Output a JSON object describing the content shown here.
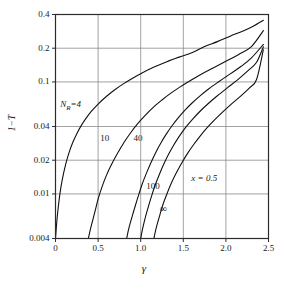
{
  "chart_data": {
    "type": "line",
    "title": "",
    "xlabel": "γ",
    "ylabel": "1−T",
    "xlim": [
      0,
      2.5
    ],
    "ylim": [
      0.004,
      0.4
    ],
    "yscale": "log",
    "xscale": "linear",
    "grid": true,
    "legend": "inline-curve-labels",
    "xticks": [
      "0",
      "0.5",
      "1.0",
      "1.5",
      "2.0",
      "2.5"
    ],
    "xtick_values": [
      0,
      0.5,
      1.0,
      1.5,
      2.0,
      2.5
    ],
    "yticks": [
      "0.4",
      "0.2",
      "0.1",
      "0.04",
      "0.02",
      "0.01",
      "0.004"
    ],
    "ytick_values": [
      0.4,
      0.2,
      0.1,
      0.04,
      0.02,
      0.01,
      0.004
    ],
    "annotations": [
      {
        "text": "N",
        "sub": "R",
        "suffix": "=4",
        "x": 0.16,
        "y": 0.062
      },
      {
        "text": "10",
        "x": 0.63,
        "y": 0.031
      },
      {
        "text": "40",
        "x": 1.02,
        "y": 0.031
      },
      {
        "text": "100",
        "x": 1.17,
        "y": 0.0115
      },
      {
        "text": "∞",
        "x": 1.33,
        "y": 0.0074
      },
      {
        "text": "x = 0.5",
        "x": 1.7,
        "y": 0.0135
      }
    ],
    "series": [
      {
        "name": "N_R=4",
        "label": "N_R=4",
        "points": [
          [
            0.0,
            0.004
          ],
          [
            0.02,
            0.0062
          ],
          [
            0.05,
            0.0098
          ],
          [
            0.08,
            0.0135
          ],
          [
            0.12,
            0.0185
          ],
          [
            0.16,
            0.0235
          ],
          [
            0.2,
            0.0285
          ],
          [
            0.25,
            0.0345
          ],
          [
            0.3,
            0.0405
          ],
          [
            0.36,
            0.0475
          ],
          [
            0.42,
            0.0545
          ],
          [
            0.5,
            0.0635
          ],
          [
            0.6,
            0.0745
          ],
          [
            0.7,
            0.0855
          ],
          [
            0.8,
            0.0965
          ],
          [
            0.9,
            0.1075
          ],
          [
            1.0,
            0.1185
          ],
          [
            1.15,
            0.135
          ],
          [
            1.3,
            0.151
          ],
          [
            1.45,
            0.1665
          ],
          [
            1.6,
            0.182
          ],
          [
            1.75,
            0.207
          ],
          [
            1.9,
            0.229
          ],
          [
            2.05,
            0.256
          ],
          [
            2.2,
            0.285
          ],
          [
            2.32,
            0.314
          ],
          [
            2.44,
            0.355
          ]
        ]
      },
      {
        "name": "10",
        "label": "10",
        "points": [
          [
            0.385,
            0.004
          ],
          [
            0.42,
            0.0052
          ],
          [
            0.46,
            0.0068
          ],
          [
            0.5,
            0.009
          ],
          [
            0.55,
            0.0118
          ],
          [
            0.6,
            0.0148
          ],
          [
            0.66,
            0.0185
          ],
          [
            0.72,
            0.0225
          ],
          [
            0.8,
            0.0285
          ],
          [
            0.88,
            0.035
          ],
          [
            0.96,
            0.042
          ],
          [
            1.05,
            0.05
          ],
          [
            1.15,
            0.0595
          ],
          [
            1.25,
            0.069
          ],
          [
            1.35,
            0.079
          ],
          [
            1.45,
            0.089
          ],
          [
            1.55,
            0.0995
          ],
          [
            1.7,
            0.116
          ],
          [
            1.85,
            0.133
          ],
          [
            2.0,
            0.153
          ],
          [
            2.15,
            0.176
          ],
          [
            2.3,
            0.207
          ],
          [
            2.44,
            0.287
          ]
        ]
      },
      {
        "name": "40",
        "label": "40",
        "points": [
          [
            0.835,
            0.004
          ],
          [
            0.86,
            0.0049
          ],
          [
            0.9,
            0.0063
          ],
          [
            0.94,
            0.008
          ],
          [
            0.98,
            0.01
          ],
          [
            1.02,
            0.0124
          ],
          [
            1.07,
            0.0155
          ],
          [
            1.12,
            0.019
          ],
          [
            1.18,
            0.0237
          ],
          [
            1.24,
            0.0288
          ],
          [
            1.3,
            0.0342
          ],
          [
            1.37,
            0.0408
          ],
          [
            1.44,
            0.0478
          ],
          [
            1.52,
            0.056
          ],
          [
            1.6,
            0.0645
          ],
          [
            1.7,
            0.0755
          ],
          [
            1.8,
            0.087
          ],
          [
            1.92,
            0.101
          ],
          [
            2.05,
            0.118
          ],
          [
            2.18,
            0.138
          ],
          [
            2.3,
            0.164
          ],
          [
            2.44,
            0.216
          ]
        ]
      },
      {
        "name": "100",
        "label": "100",
        "points": [
          [
            1.0,
            0.004
          ],
          [
            1.02,
            0.0048
          ],
          [
            1.05,
            0.006
          ],
          [
            1.09,
            0.0077
          ],
          [
            1.13,
            0.0097
          ],
          [
            1.17,
            0.012
          ],
          [
            1.22,
            0.015
          ],
          [
            1.27,
            0.0184
          ],
          [
            1.33,
            0.0228
          ],
          [
            1.39,
            0.0275
          ],
          [
            1.46,
            0.0333
          ],
          [
            1.53,
            0.0395
          ],
          [
            1.61,
            0.0466
          ],
          [
            1.7,
            0.055
          ],
          [
            1.8,
            0.0648
          ],
          [
            1.9,
            0.0752
          ],
          [
            2.02,
            0.089
          ],
          [
            2.14,
            0.105
          ],
          [
            2.26,
            0.126
          ],
          [
            2.36,
            0.15
          ],
          [
            2.44,
            0.206
          ]
        ]
      },
      {
        "name": "infinity",
        "label": "∞",
        "points": [
          [
            1.155,
            0.004
          ],
          [
            1.18,
            0.0049
          ],
          [
            1.22,
            0.0063
          ],
          [
            1.26,
            0.008
          ],
          [
            1.31,
            0.0101
          ],
          [
            1.36,
            0.0125
          ],
          [
            1.42,
            0.0155
          ],
          [
            1.48,
            0.0188
          ],
          [
            1.55,
            0.023
          ],
          [
            1.62,
            0.0275
          ],
          [
            1.7,
            0.033
          ],
          [
            1.78,
            0.039
          ],
          [
            1.87,
            0.046
          ],
          [
            1.97,
            0.0545
          ],
          [
            2.07,
            0.064
          ],
          [
            2.18,
            0.0755
          ],
          [
            2.28,
            0.089
          ],
          [
            2.36,
            0.105
          ],
          [
            2.44,
            0.194
          ]
        ]
      }
    ]
  },
  "axes": {
    "y_title": "1−T",
    "x_title": "γ"
  },
  "style": {
    "axis_color": "#2b2b2b",
    "grid_color": "#8a8a8a",
    "curve_color": "#101010",
    "background": "#ffffff"
  }
}
